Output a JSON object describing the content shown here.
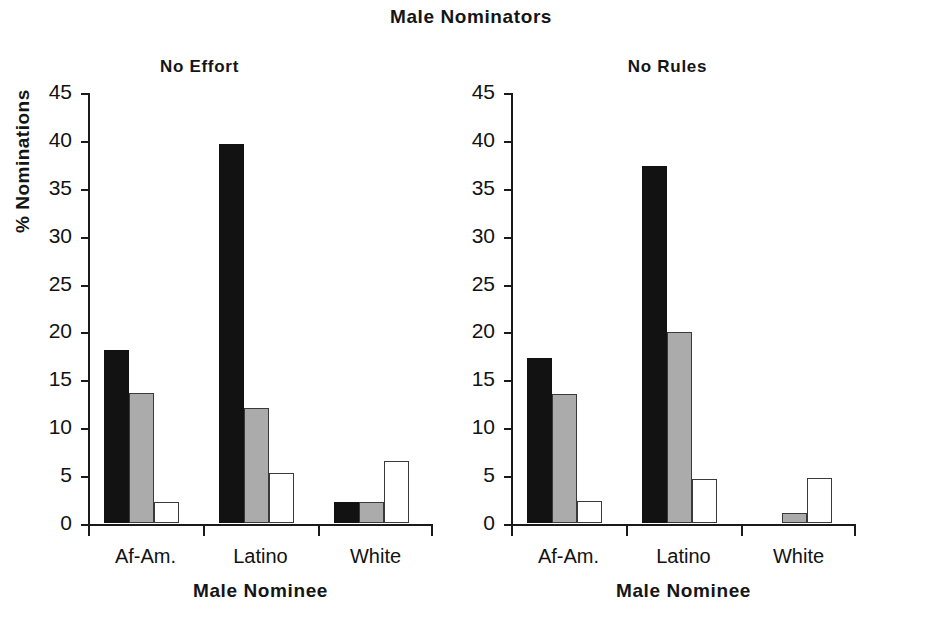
{
  "figure": {
    "title": "Male Nominators",
    "background": "#ffffff"
  },
  "chart_data": {
    "type": "bar",
    "title": "Male Nominators",
    "panels": [
      {
        "title": "No Effort",
        "xlabel": "Male Nominee",
        "ylabel": "% Nominations",
        "categories": [
          "Af-Am.",
          "Latino",
          "White"
        ],
        "ylim": [
          0,
          45
        ],
        "yticks": [
          0,
          5,
          10,
          15,
          20,
          25,
          30,
          35,
          40,
          45
        ],
        "grid": false,
        "legend": "none",
        "series": [
          {
            "name": "series-1",
            "color": "#121212",
            "values": [
              18.1,
              39.6,
              2.2
            ]
          },
          {
            "name": "series-2",
            "color": "#ababab",
            "values": [
              13.6,
              12.0,
              2.2
            ]
          },
          {
            "name": "series-3",
            "color": "#ffffff",
            "values": [
              2.2,
              5.2,
              6.5
            ]
          }
        ]
      },
      {
        "title": "No Rules",
        "xlabel": "Male Nominee",
        "ylabel": "",
        "categories": [
          "Af-Am.",
          "Latino",
          "White"
        ],
        "ylim": [
          0,
          45
        ],
        "yticks": [
          0,
          5,
          10,
          15,
          20,
          25,
          30,
          35,
          40,
          45
        ],
        "grid": false,
        "legend": "none",
        "series": [
          {
            "name": "series-1",
            "color": "#121212",
            "values": [
              17.2,
              37.3,
              0.0
            ]
          },
          {
            "name": "series-2",
            "color": "#ababab",
            "values": [
              13.5,
              19.9,
              1.0
            ]
          },
          {
            "name": "series-3",
            "color": "#ffffff",
            "values": [
              2.3,
              4.6,
              4.7
            ]
          }
        ]
      }
    ]
  }
}
